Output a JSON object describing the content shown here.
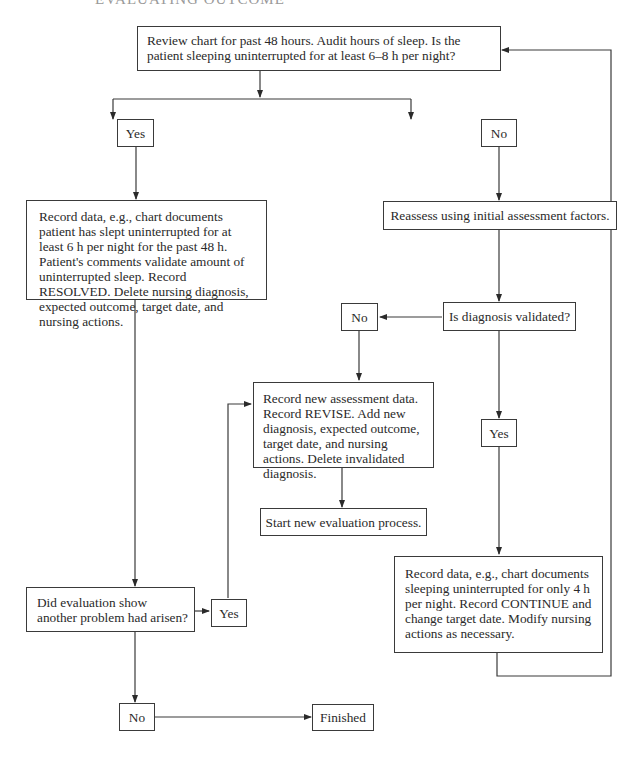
{
  "header": {
    "text": "EVALUATING OUTCOME"
  },
  "flowchart": {
    "start": {
      "text": "Review chart for past 48 hours. Audit hours of sleep. Is the patient sleeping uninterrupted for at least 6–8 h per night?"
    },
    "yes_1": {
      "text": "Yes"
    },
    "no_1": {
      "text": "No"
    },
    "resolved": {
      "text": "Record data, e.g., chart documents patient has slept uninterrupted for at least 6 h per night for the past 48 h. Patient's comments validate amount of uninterrupted sleep. Record RESOLVED. Delete nursing diagnosis, expected outcome, target date, and nursing actions."
    },
    "reassess": {
      "text": "Reassess using initial assessment factors."
    },
    "diagnosis_validated": {
      "text": "Is diagnosis validated?"
    },
    "no_2": {
      "text": "No"
    },
    "yes_2": {
      "text": "Yes"
    },
    "revise": {
      "text": "Record new assessment data. Record REVISE. Add new diagnosis, expected outcome, target date, and nursing actions. Delete invalidated diagnosis."
    },
    "new_evaluation": {
      "text": "Start new evaluation process."
    },
    "continue": {
      "text": "Record data, e.g., chart documents sleeping uninterrupted for only 4 h per night. Record CONTINUE and change target date. Modify nursing actions as necessary."
    },
    "another_problem": {
      "text": "Did evaluation show another problem had arisen?"
    },
    "yes_3": {
      "text": "Yes"
    },
    "no_3": {
      "text": "No"
    },
    "finished": {
      "text": "Finished"
    }
  },
  "colors": {
    "line": "#3a3a3a",
    "text": "#2a2a2a",
    "background": "#ffffff"
  }
}
